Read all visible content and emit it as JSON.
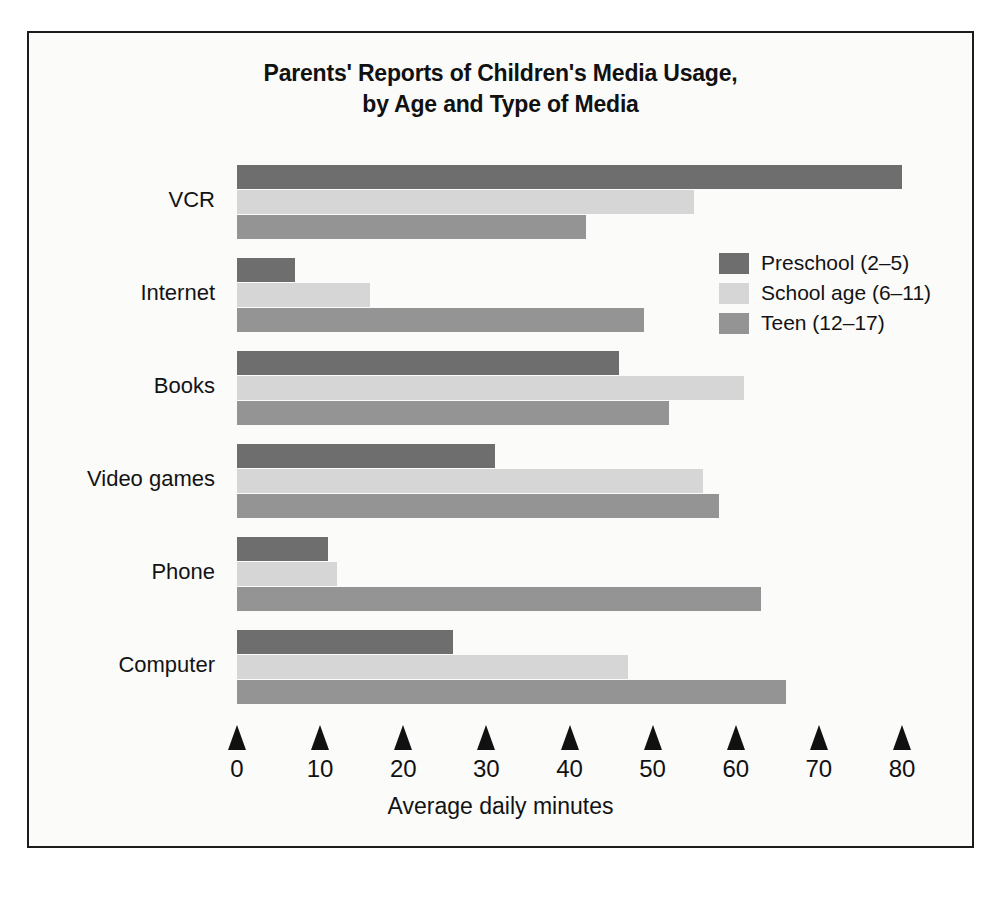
{
  "figure": {
    "title_line_1": "Parents' Reports of Children's Media Usage,",
    "title_line_2": "by Age and Type of Media",
    "border_color": "#1c1c1c",
    "background_color": "#fbfbfa"
  },
  "chart_data": {
    "type": "bar",
    "orientation": "horizontal",
    "title": "Parents' Reports of Children's Media Usage, by Age and Type of Media",
    "xlabel": "Average daily minutes",
    "ylabel": "",
    "xlim": [
      0,
      80
    ],
    "xticks": [
      0,
      10,
      20,
      30,
      40,
      50,
      60,
      70,
      80
    ],
    "xtick_labels": [
      "0",
      "10",
      "20",
      "30",
      "40",
      "50",
      "60",
      "70",
      "80"
    ],
    "grid": false,
    "legend_position": "upper right inside",
    "categories": [
      "VCR",
      "Internet",
      "Books",
      "Video games",
      "Phone",
      "Computer"
    ],
    "series": [
      {
        "name": "Preschool (2–5)",
        "color": "#6e6e6e",
        "values": [
          80,
          7,
          46,
          31,
          11,
          26
        ]
      },
      {
        "name": "School age (6–11)",
        "color": "#d6d6d6",
        "values": [
          55,
          16,
          61,
          56,
          12,
          47
        ]
      },
      {
        "name": "Teen (12–17)",
        "color": "#949494",
        "values": [
          42,
          49,
          52,
          58,
          63,
          66
        ]
      }
    ]
  }
}
